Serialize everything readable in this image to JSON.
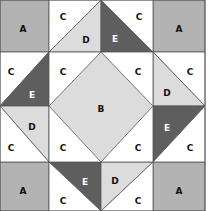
{
  "diagram": {
    "type": "quilt-block",
    "grid": {
      "cols": 4,
      "rows": 4
    },
    "colors": {
      "A": "#b3b3b3",
      "B": "#dcdcdc",
      "C": "#ffffff",
      "D": "#dcdcdc",
      "E": "#5e5e5e",
      "line": "#555555",
      "label_dark": "#111111",
      "label_light": "#ffffff"
    },
    "pieces": {
      "a_tl": "A",
      "a_tr": "A",
      "a_bl": "A",
      "a_br": "A",
      "b_center": "B",
      "c_top1": "C",
      "c_top2": "C",
      "c_left1": "C",
      "c_left2": "C",
      "c_right1": "C",
      "c_right2": "C",
      "c_bottom1": "C",
      "c_bottom2": "C",
      "c_center_tl": "C",
      "c_center_tr": "C",
      "c_center_bl": "C",
      "c_center_br": "C",
      "d_top": "D",
      "d_right": "D",
      "d_left": "D",
      "d_bottom": "D",
      "e_top": "E",
      "e_right": "E",
      "e_left": "E",
      "e_bottom": "E"
    }
  }
}
